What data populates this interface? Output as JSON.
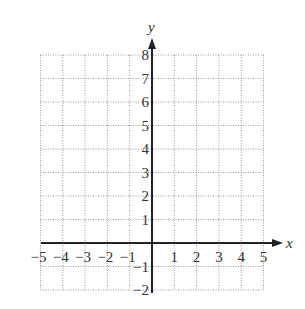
{
  "diagram": {
    "type": "coordinate-grid",
    "x_axis": {
      "label": "x",
      "min": -5,
      "max": 5,
      "ticks": [
        "−5",
        "−4",
        "−3",
        "−2",
        "−1",
        "1",
        "2",
        "3",
        "4",
        "5"
      ]
    },
    "y_axis": {
      "label": "y",
      "min": -2,
      "max": 8,
      "ticks": [
        "8",
        "7",
        "6",
        "5",
        "4",
        "3",
        "2",
        "1",
        "−1",
        "−2"
      ]
    },
    "grid": {
      "style": "dotted",
      "color": "#9a9a9a"
    },
    "axis_color": "#222222"
  }
}
